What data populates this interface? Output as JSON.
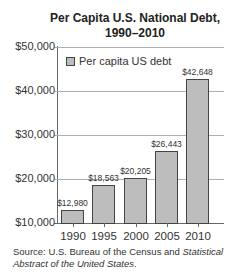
{
  "chart_data": {
    "type": "bar",
    "title": "Per Capita U.S. National Debt, 1990–2010",
    "title_line1": "Per Capita U.S. National Debt,",
    "title_line2": "1990–2010",
    "categories": [
      "1990",
      "1995",
      "2000",
      "2005",
      "2010"
    ],
    "series": [
      {
        "name": "Per capita US debt",
        "values": [
          12980,
          18563,
          20205,
          26443,
          42648
        ]
      }
    ],
    "value_labels": [
      "$12,980",
      "$18,563",
      "$20,205",
      "$26,443",
      "$42,648"
    ],
    "xlabel": "",
    "ylabel": "",
    "ylim": [
      10000,
      50000
    ],
    "yticks": [
      10000,
      20000,
      30000,
      40000,
      50000
    ],
    "ytick_labels": [
      "$10,000",
      "$20,000",
      "$30,000",
      "$40,000",
      "$50,000"
    ],
    "grid": true,
    "legend_position": "upper left",
    "bar_color": "#bdbdbd",
    "bar_edge_color": "#444444"
  },
  "legend": {
    "label": "Per capita US debt"
  },
  "source": {
    "prefix": "Source: U.S. Bureau of the Census and ",
    "italic_1": "Statistical",
    "italic_2": "Abstract of the United States",
    "suffix": "."
  }
}
